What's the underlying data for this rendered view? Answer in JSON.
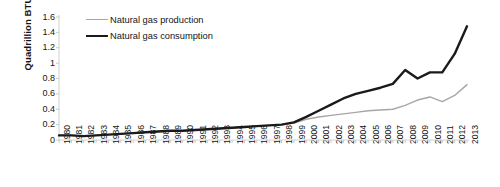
{
  "chart_data": {
    "type": "line",
    "title": "",
    "xlabel": "",
    "ylabel": "Quadrillion BTU",
    "ylim": [
      0,
      1.6
    ],
    "ytick_labels": [
      "1.6",
      "1.4",
      "1.2",
      "1",
      "0.8",
      "0.6",
      "0.4",
      "0.2",
      "0"
    ],
    "ytick_values": [
      1.6,
      1.4,
      1.2,
      1,
      0.8,
      0.6,
      0.4,
      0.2,
      0
    ],
    "grid": false,
    "legend_position": "top-left-inside",
    "x": [
      1980,
      1981,
      1982,
      1983,
      1984,
      1985,
      1986,
      1987,
      1988,
      1989,
      1990,
      1991,
      1992,
      1993,
      1994,
      1995,
      1996,
      1997,
      1998,
      1999,
      2000,
      2001,
      2002,
      2003,
      2004,
      2005,
      2006,
      2007,
      2008,
      2009,
      2010,
      2011,
      2012,
      2013
    ],
    "categories": [
      "1980",
      "1981",
      "1982",
      "1983",
      "1984",
      "1985",
      "1986",
      "1987",
      "1988",
      "1989",
      "1990",
      "1991",
      "1992",
      "1993",
      "1994",
      "1995",
      "1996",
      "1997",
      "1998",
      "1999",
      "2000",
      "2001",
      "2002",
      "2003",
      "2004",
      "2005",
      "2006",
      "2007",
      "2008",
      "2009",
      "2010",
      "2011",
      "2012",
      "2013"
    ],
    "series": [
      {
        "name": "Natural gas production",
        "color": "#a6a6a6",
        "line_width": 1.4,
        "values": [
          0.06,
          0.06,
          0.05,
          0.06,
          0.07,
          0.08,
          0.09,
          0.1,
          0.11,
          0.12,
          0.12,
          0.13,
          0.14,
          0.15,
          0.16,
          0.17,
          0.18,
          0.19,
          0.2,
          0.22,
          0.27,
          0.3,
          0.32,
          0.34,
          0.36,
          0.38,
          0.39,
          0.4,
          0.45,
          0.52,
          0.56,
          0.5,
          0.58,
          0.72
        ]
      },
      {
        "name": "Natural gas consumption",
        "color": "#1a1a1a",
        "line_width": 2.4,
        "values": [
          0.06,
          0.06,
          0.05,
          0.06,
          0.07,
          0.08,
          0.09,
          0.1,
          0.11,
          0.12,
          0.12,
          0.13,
          0.14,
          0.15,
          0.16,
          0.17,
          0.18,
          0.19,
          0.2,
          0.23,
          0.3,
          0.38,
          0.46,
          0.54,
          0.6,
          0.64,
          0.68,
          0.73,
          0.91,
          0.8,
          0.88,
          0.88,
          1.12,
          1.48
        ]
      }
    ]
  },
  "legend": {
    "entries": [
      {
        "label": "Natural gas production",
        "style": "production"
      },
      {
        "label": "Natural gas consumption",
        "style": "consumption"
      }
    ]
  },
  "axes": {
    "y_title": "Quadrillion BTU"
  }
}
